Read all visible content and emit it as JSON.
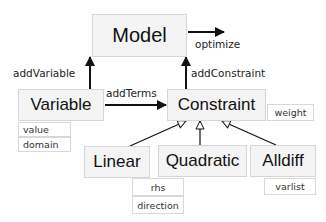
{
  "diagram": {
    "nodes": {
      "model": "Model",
      "variable": "Variable",
      "constraint": "Constraint",
      "linear": "Linear",
      "quadratic": "Quadratic",
      "alldiff": "Alldiff"
    },
    "attributes": {
      "variable": [
        "value",
        "domain"
      ],
      "constraint": [
        "weight"
      ],
      "linear": [
        "rhs",
        "direction"
      ],
      "alldiff": [
        "varlist"
      ]
    },
    "edge_labels": {
      "optimize": "optimize",
      "add_variable": "addVariable",
      "add_constraint": "addConstraint",
      "add_terms": "addTerms"
    },
    "colors": {
      "box_fill": "#f4f4f4",
      "box_border": "#d6d6d6",
      "arrow": "#111111"
    }
  }
}
